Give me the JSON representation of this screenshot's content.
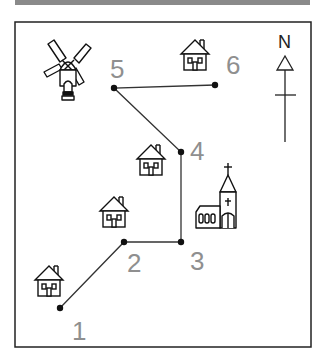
{
  "header_bar": {
    "color": "#8a8a8a"
  },
  "map": {
    "frame_color": "#222222",
    "path_color": "#333333",
    "label_color": "#8f8f8f",
    "compass": {
      "label": "N"
    },
    "points": [
      {
        "label": "1",
        "x": 60,
        "y": 308,
        "landmark": "house"
      },
      {
        "label": "2",
        "x": 124,
        "y": 242,
        "landmark": "house"
      },
      {
        "label": "3",
        "x": 181,
        "y": 242,
        "landmark": "church"
      },
      {
        "label": "4",
        "x": 181,
        "y": 152,
        "landmark": "house"
      },
      {
        "label": "5",
        "x": 114,
        "y": 88,
        "landmark": "windmill"
      },
      {
        "label": "6",
        "x": 215,
        "y": 85,
        "landmark": "house"
      }
    ],
    "icons": [
      "windmill-icon",
      "house-icon",
      "church-icon",
      "north-arrow-icon"
    ]
  }
}
